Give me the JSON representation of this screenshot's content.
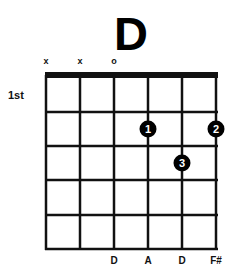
{
  "chord": {
    "name": "D",
    "start_fret_label": "1st",
    "string_markers": [
      "x",
      "x",
      "o",
      "",
      "",
      ""
    ],
    "notes": [
      "",
      "",
      "D",
      "A",
      "D",
      "F#"
    ],
    "fingers": [
      {
        "string": 4,
        "fret": 2,
        "label": "1"
      },
      {
        "string": 6,
        "fret": 2,
        "label": "2"
      },
      {
        "string": 5,
        "fret": 3,
        "label": "3"
      }
    ],
    "num_strings": 6,
    "num_frets": 5
  },
  "colors": {
    "line": "#111111",
    "dot": "#000000",
    "dot_text": "#ffffff",
    "background": "#ffffff"
  }
}
